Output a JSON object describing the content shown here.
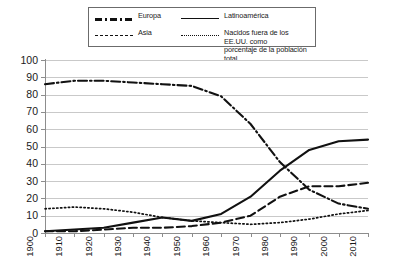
{
  "legend": {
    "entries": [
      {
        "name": "europa",
        "label": "Europa",
        "style": "dash-dot"
      },
      {
        "name": "latinoamerica",
        "label": "Latinoamérica",
        "style": "solid"
      },
      {
        "name": "asia",
        "label": "Asia",
        "style": "dashed"
      },
      {
        "name": "nacidos-fuera",
        "label": "Nacidos fuera de los EE.UU. como\nporcentaje de la población total",
        "style": "dotted"
      }
    ]
  },
  "axes": {
    "y_ticks": [
      "100",
      "90",
      "80",
      "70",
      "60",
      "50",
      "40",
      "30",
      "20",
      "10",
      "0"
    ],
    "x_ticks": [
      "1900",
      "1910",
      "1920",
      "1930",
      "1940",
      "1950",
      "1960",
      "1970",
      "1980",
      "1990",
      "2000",
      "2010"
    ]
  },
  "chart_data": {
    "type": "line",
    "title": "",
    "xlabel": "",
    "ylabel": "",
    "xlim": [
      1900,
      2010
    ],
    "ylim": [
      0,
      100
    ],
    "grid": true,
    "legend_position": "top",
    "x": [
      1900,
      1910,
      1920,
      1930,
      1940,
      1950,
      1960,
      1970,
      1980,
      1990,
      2000,
      2010
    ],
    "categories": [
      "1900",
      "1910",
      "1920",
      "1930",
      "1940",
      "1950",
      "1960",
      "1970",
      "1980",
      "1990",
      "2000",
      "2010"
    ],
    "series": [
      {
        "name": "Europa",
        "style": "dash-dot",
        "color": "#111111",
        "values": [
          86,
          88,
          88,
          87,
          86,
          85,
          79,
          63,
          41,
          25,
          17,
          14
        ]
      },
      {
        "name": "Latinoamérica",
        "style": "solid",
        "color": "#111111",
        "values": [
          1,
          2,
          3,
          6,
          9,
          7,
          11,
          21,
          36,
          48,
          53,
          54
        ]
      },
      {
        "name": "Asia",
        "style": "dashed",
        "color": "#111111",
        "values": [
          1,
          1,
          2,
          3,
          3,
          4,
          6,
          10,
          21,
          27,
          27,
          29
        ]
      },
      {
        "name": "Nacidos fuera de los EE.UU. como porcentaje de la población total",
        "style": "dotted",
        "color": "#111111",
        "values": [
          14,
          15,
          14,
          12,
          9,
          7,
          6,
          5,
          6,
          8,
          11,
          13
        ]
      }
    ]
  }
}
